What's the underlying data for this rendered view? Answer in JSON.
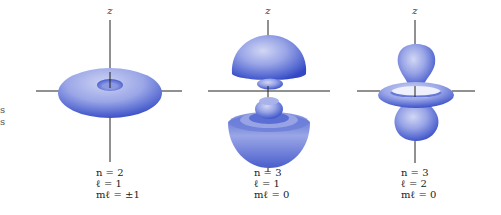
{
  "figure": {
    "type": "atomic-orbital-probability-densities",
    "colors": {
      "highlight": "#c4caf0",
      "mid": "#7d8ddf",
      "shadow": "#3448c4",
      "axis": "#222222",
      "background": "#ffffff"
    },
    "margin_fragments": [
      "s",
      "s"
    ],
    "orbitals": [
      {
        "id": "n2-l1-ml-pm1",
        "axis_label": "z",
        "shape": "torus",
        "n_label": "n = 2",
        "l_label": "ℓ = 1",
        "ml_label": "mℓ = ±1",
        "n_value": "2",
        "l_value": "1",
        "ml_value": "±1"
      },
      {
        "id": "n3-l1-ml-0",
        "axis_label": "z",
        "shape": "dumbbell-with-inner-lobes",
        "n_label": "n = 3",
        "l_label": "ℓ = 1",
        "ml_label": "mℓ = 0",
        "n_value": "3",
        "l_value": "1",
        "ml_value": "0"
      },
      {
        "id": "n3-l2-ml-0",
        "axis_label": "z",
        "shape": "dz2-lobes-with-ring",
        "n_label": "n = 3",
        "l_label": "ℓ = 2",
        "ml_label": "mℓ = 0",
        "n_value": "3",
        "l_value": "2",
        "ml_value": "0"
      }
    ]
  }
}
